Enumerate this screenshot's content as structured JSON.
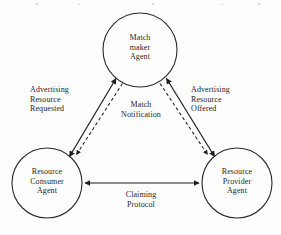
{
  "diagram": {
    "type": "agent-interaction-triangle",
    "background_color": "#fdfdfd",
    "stroke_color": "#1d1d1d",
    "nodes": [
      {
        "id": "matchmaker",
        "name": "matchmaker-agent-node",
        "lines": [
          "Match",
          "maker",
          "Agent"
        ],
        "line1": "Match",
        "line2": "maker",
        "line3": "Agent",
        "cx": 140,
        "cy": 50,
        "r": 37
      },
      {
        "id": "consumer",
        "name": "resource-consumer-agent-node",
        "lines": [
          "Resource",
          "Consumer",
          "Agent"
        ],
        "line1": "Resource",
        "line2": "Consumer",
        "line3": "Agent",
        "cx": 47,
        "cy": 183,
        "r": 35
      },
      {
        "id": "provider",
        "name": "resource-provider-agent-node",
        "lines": [
          "Resource",
          "Provider",
          "Agent"
        ],
        "line1": "Resource",
        "line2": "Provider",
        "line3": "Agent",
        "cx": 237,
        "cy": 183,
        "r": 35
      }
    ],
    "edges": [
      {
        "id": "advertising-requested",
        "name": "edge-advertising-resource-requested",
        "style": "solid",
        "arrows": "both",
        "from": "consumer",
        "to": "matchmaker",
        "line1": "Advertising",
        "line2": "Resource",
        "line3": "Requested"
      },
      {
        "id": "advertising-offered",
        "name": "edge-advertising-resource-offered",
        "style": "solid",
        "arrows": "both",
        "from": "provider",
        "to": "matchmaker",
        "line1": "Advertising",
        "line2": "Resource",
        "line3": "Offered"
      },
      {
        "id": "match-notification",
        "name": "edge-match-notification",
        "style": "dashed",
        "arrows": "forward",
        "from": "matchmaker",
        "to": "consumer-and-provider",
        "line1": "Match",
        "line2": "Notification"
      },
      {
        "id": "claiming-protocol",
        "name": "edge-claiming-protocol",
        "style": "solid",
        "arrows": "both",
        "from": "consumer",
        "to": "provider",
        "line1": "Claiming",
        "line2": "Protocol"
      }
    ]
  }
}
